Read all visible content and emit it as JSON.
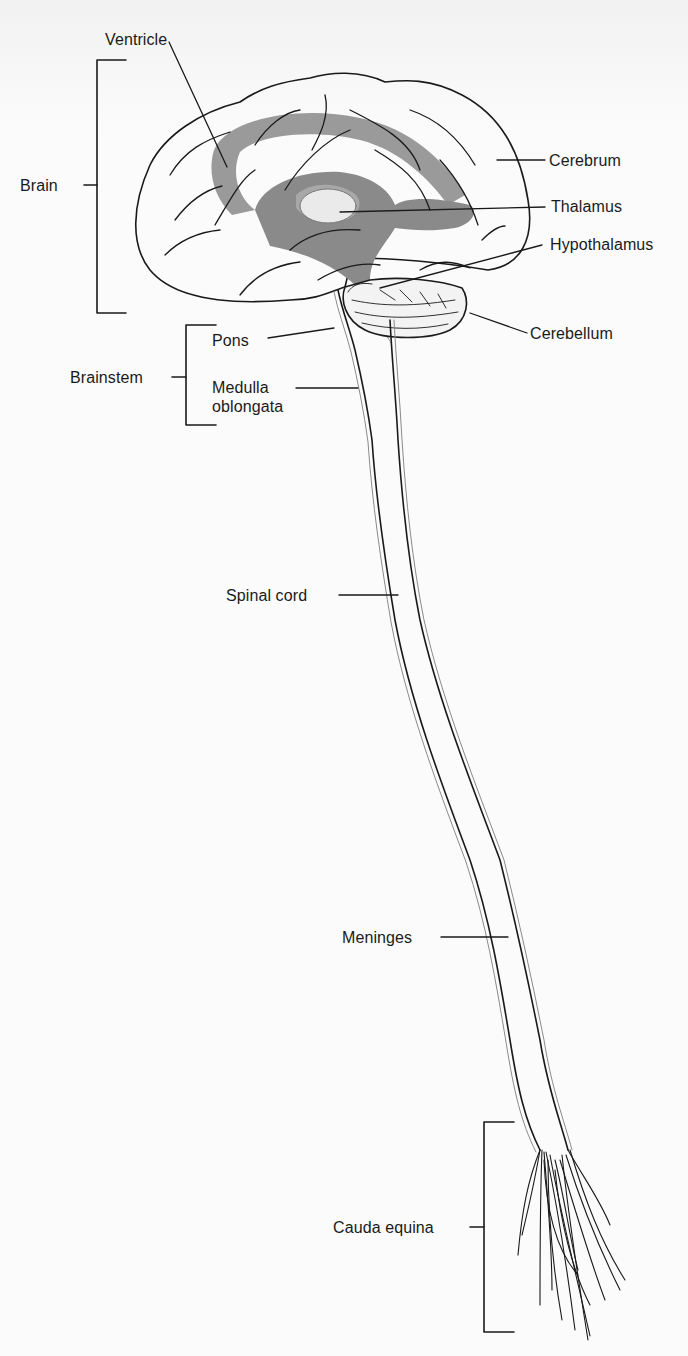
{
  "figure": {
    "colors": {
      "background": "#fbfbfb",
      "outline": "#1a1a1a",
      "ventricle_gray": "#8a8a8a",
      "label_text": "#1a1a1a"
    }
  },
  "labels": {
    "ventricle": "Ventricle",
    "brain": "Brain",
    "cerebrum": "Cerebrum",
    "thalamus": "Thalamus",
    "hypothalamus": "Hypothalamus",
    "cerebellum": "Cerebellum",
    "pons": "Pons",
    "brainstem": "Brainstem",
    "medulla_line1": "Medulla",
    "medulla_line2": "oblongata",
    "spinal_cord": "Spinal cord",
    "meninges": "Meninges",
    "cauda_equina": "Cauda equina"
  }
}
